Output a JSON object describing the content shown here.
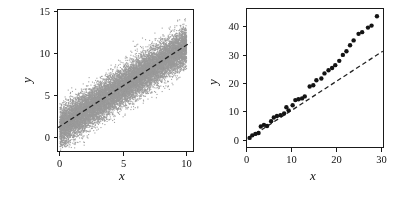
{
  "figure": {
    "background": "#ffffff",
    "frame_color": "#1a1a1a",
    "tick_label_color": "#111111"
  },
  "chart_data": [
    {
      "id": "left-panel",
      "type": "scatter",
      "title": "",
      "xlabel": "x",
      "ylabel": "y",
      "xlim": [
        -0.16,
        10.55
      ],
      "ylim": [
        -1.67,
        15.24
      ],
      "xticks": [
        0,
        5,
        10
      ],
      "yticks": [
        0,
        5,
        10,
        15
      ],
      "xtick_labels": [
        "0",
        "5",
        "10"
      ],
      "ytick_labels": [
        "0",
        "5",
        "10",
        "15"
      ],
      "grid": false,
      "legend": null,
      "marker": {
        "color": "#9a9a9a",
        "size_px": 1.1,
        "shape": "square-pixel"
      },
      "cloud_model": {
        "kind": "linear_gaussian",
        "n": 16000,
        "seed": 7,
        "x_uniform": [
          0.03,
          10.0
        ],
        "intercept": 1.2,
        "slope": 0.97,
        "noise_sd": 1.12
      },
      "fit_line": {
        "dashed": true,
        "color": "#222222",
        "x1": -0.1,
        "y1": 1.1,
        "x2": 10.35,
        "y2": 11.25
      }
    },
    {
      "id": "right-panel",
      "type": "scatter",
      "title": "",
      "xlabel": "x",
      "ylabel": "y",
      "xlim": [
        0,
        30.55
      ],
      "ylim": [
        -2.5,
        46.4
      ],
      "xticks": [
        0,
        10,
        20,
        30
      ],
      "yticks": [
        0,
        10,
        20,
        30,
        40
      ],
      "xtick_labels": [
        "0",
        "10",
        "20",
        "30"
      ],
      "ytick_labels": [
        "0",
        "10",
        "20",
        "30",
        "40"
      ],
      "grid": false,
      "legend": null,
      "marker": {
        "color": "#141414",
        "size_px": 4.4,
        "shape": "circle"
      },
      "points": [
        [
          0.8,
          0.7
        ],
        [
          1.4,
          1.6
        ],
        [
          2.1,
          2.1
        ],
        [
          2.8,
          2.4
        ],
        [
          3.3,
          4.7
        ],
        [
          4.0,
          5.3
        ],
        [
          4.7,
          4.9
        ],
        [
          5.6,
          6.6
        ],
        [
          6.2,
          7.9
        ],
        [
          6.9,
          8.4
        ],
        [
          7.7,
          8.7
        ],
        [
          8.5,
          9.3
        ],
        [
          9.0,
          11.5
        ],
        [
          9.5,
          10.4
        ],
        [
          10.4,
          12.2
        ],
        [
          11.0,
          14.0
        ],
        [
          11.7,
          14.3
        ],
        [
          12.5,
          14.6
        ],
        [
          13.1,
          15.3
        ],
        [
          14.2,
          18.8
        ],
        [
          15.0,
          19.2
        ],
        [
          15.7,
          21.0
        ],
        [
          16.8,
          21.6
        ],
        [
          17.5,
          23.4
        ],
        [
          18.4,
          24.5
        ],
        [
          19.2,
          25.3
        ],
        [
          19.9,
          26.3
        ],
        [
          20.8,
          27.8
        ],
        [
          21.6,
          29.9
        ],
        [
          22.4,
          31.2
        ],
        [
          23.2,
          33.3
        ],
        [
          24.0,
          35.0
        ],
        [
          25.1,
          37.3
        ],
        [
          25.9,
          37.9
        ],
        [
          27.2,
          39.5
        ],
        [
          28.0,
          40.2
        ],
        [
          29.2,
          43.5
        ]
      ],
      "ref_line": {
        "dashed": true,
        "color": "#222222",
        "x1": 0.7,
        "y1": 0.7,
        "x2": 30.5,
        "y2": 31.2
      }
    }
  ]
}
